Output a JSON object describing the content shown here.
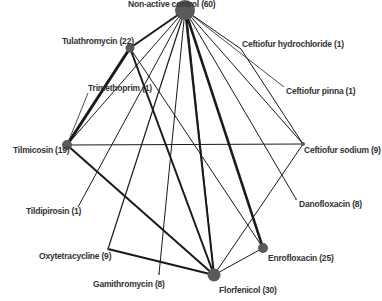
{
  "diagram": {
    "type": "network",
    "colors": {
      "node": "#5a5a5a",
      "edge": "#1a1a1a",
      "label": "#333333",
      "background": "#ffffff"
    },
    "nodes": [
      {
        "id": "nac",
        "label": "Non-active control (60)",
        "x": 185,
        "y": 10,
        "r": 10,
        "lx": 128,
        "ly": -1
      },
      {
        "id": "tul",
        "label": "Tulathromycin (22)",
        "x": 130,
        "y": 48,
        "r": 4.5,
        "lx": 62,
        "ly": 36
      },
      {
        "id": "tri",
        "label": "Trimethoprim (1)",
        "x": 88,
        "y": 93,
        "r": 0,
        "lx": 88,
        "ly": 83
      },
      {
        "id": "til",
        "label": "Tilmicosin (19)",
        "x": 67,
        "y": 145,
        "r": 5,
        "lx": 13,
        "ly": 145
      },
      {
        "id": "tild",
        "label": "Tildipirosin (1)",
        "x": 78,
        "y": 207,
        "r": 0,
        "lx": 26,
        "ly": 206
      },
      {
        "id": "oxy",
        "label": "Oxytetracycline (9)",
        "x": 108,
        "y": 249,
        "r": 1,
        "lx": 39,
        "ly": 251
      },
      {
        "id": "gam",
        "label": "Gamithromycin (8)",
        "x": 159,
        "y": 274,
        "r": 1,
        "lx": 93,
        "ly": 279
      },
      {
        "id": "flo",
        "label": "Florfenicol (30)",
        "x": 214,
        "y": 275,
        "r": 6.5,
        "lx": 219,
        "ly": 285
      },
      {
        "id": "enr",
        "label": "Enrofloxacin (25)",
        "x": 263,
        "y": 248,
        "r": 5,
        "lx": 268,
        "ly": 253
      },
      {
        "id": "dan",
        "label": "Danofloxacin (8)",
        "x": 296,
        "y": 199,
        "r": 1,
        "lx": 299,
        "ly": 199
      },
      {
        "id": "cso",
        "label": "Ceftiofur sodium (9)",
        "x": 303,
        "y": 144,
        "r": 2,
        "lx": 304,
        "ly": 145
      },
      {
        "id": "chc",
        "label": "Ceftiofur hydrochloride (1)",
        "x": 241,
        "y": 49,
        "r": 0,
        "lx": 242,
        "ly": 39
      },
      {
        "id": "cpi",
        "label": "Ceftiofur pinna (1)",
        "x": 284,
        "y": 87,
        "r": 0,
        "lx": 286,
        "ly": 86
      }
    ],
    "edges": [
      {
        "from": "nac",
        "to": "tul",
        "w": 2
      },
      {
        "from": "nac",
        "to": "til",
        "w": 1
      },
      {
        "from": "nac",
        "to": "tild",
        "w": 1
      },
      {
        "from": "nac",
        "to": "oxy",
        "w": 1.2
      },
      {
        "from": "nac",
        "to": "gam",
        "w": 1
      },
      {
        "from": "nac",
        "to": "flo",
        "w": 2
      },
      {
        "from": "nac",
        "to": "flo",
        "w": 1,
        "dx": 6
      },
      {
        "from": "nac",
        "to": "enr",
        "w": 2.5
      },
      {
        "from": "nac",
        "to": "dan",
        "w": 1
      },
      {
        "from": "nac",
        "to": "cso",
        "w": 1
      },
      {
        "from": "nac",
        "to": "chc",
        "w": 1
      },
      {
        "from": "nac",
        "to": "cpi",
        "w": 0.8
      },
      {
        "from": "tul",
        "to": "til",
        "w": 3
      },
      {
        "from": "tul",
        "to": "flo",
        "w": 2
      },
      {
        "from": "tul",
        "to": "enr",
        "w": 1
      },
      {
        "from": "tri",
        "to": "til",
        "w": 0.8
      },
      {
        "from": "til",
        "to": "cso",
        "w": 1
      },
      {
        "from": "til",
        "to": "flo",
        "w": 2
      },
      {
        "from": "oxy",
        "to": "flo",
        "w": 2
      },
      {
        "from": "flo",
        "to": "enr",
        "w": 1
      },
      {
        "from": "flo",
        "to": "cso",
        "w": 1
      },
      {
        "from": "chc",
        "to": "cso",
        "w": 1
      }
    ]
  }
}
